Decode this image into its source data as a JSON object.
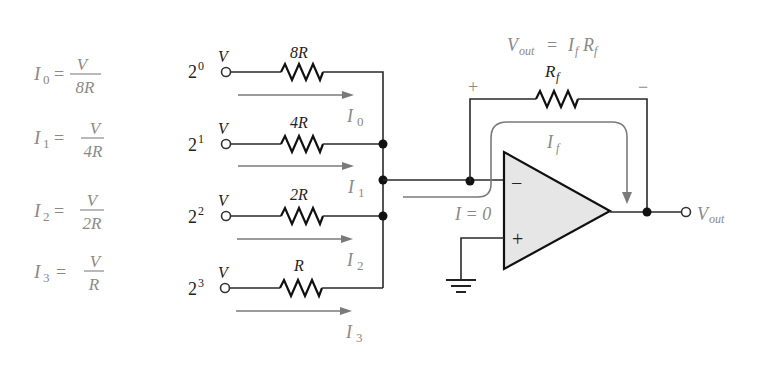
{
  "equations": [
    {
      "lhs_sym": "I",
      "lhs_sub": "0",
      "num": "V",
      "den": "8R"
    },
    {
      "lhs_sym": "I",
      "lhs_sub": "1",
      "num": "V",
      "den": "4R"
    },
    {
      "lhs_sym": "I",
      "lhs_sub": "2",
      "num": "V",
      "den": "2R"
    },
    {
      "lhs_sym": "I",
      "lhs_sub": "3",
      "num": "V",
      "den": "R"
    }
  ],
  "equals": "=",
  "inputs": [
    {
      "weight_base": "2",
      "weight_exp": "0",
      "voltage": "V",
      "resistor": "8R",
      "current_sym": "I",
      "current_sub": "0"
    },
    {
      "weight_base": "2",
      "weight_exp": "1",
      "voltage": "V",
      "resistor": "4R",
      "current_sym": "I",
      "current_sub": "1"
    },
    {
      "weight_base": "2",
      "weight_exp": "2",
      "voltage": "V",
      "resistor": "2R",
      "current_sym": "I",
      "current_sub": "2"
    },
    {
      "weight_base": "2",
      "weight_exp": "3",
      "voltage": "V",
      "resistor": "R",
      "current_sym": "I",
      "current_sub": "3"
    }
  ],
  "feedback": {
    "resistor_sym": "R",
    "resistor_sub": "f",
    "plus": "+",
    "minus": "−",
    "current_sym": "I",
    "current_sub": "f"
  },
  "formula": {
    "v": "V",
    "v_sub": "out",
    "eq": "=",
    "i": "I",
    "i_sub": "f",
    "r": "R",
    "r_sub": "f"
  },
  "opamp": {
    "inverting": "−",
    "noninverting": "+",
    "input_current": "I = 0"
  },
  "output": {
    "sym": "V",
    "sub": "out"
  },
  "colors": {
    "wire": "#2a2a2a",
    "label_gray": "#8a8a8a",
    "opamp_fill": "#e6e6e6"
  }
}
